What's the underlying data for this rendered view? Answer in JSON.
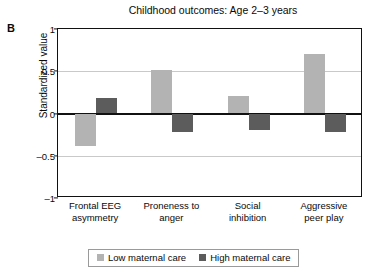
{
  "panel": {
    "label": "B"
  },
  "chart_data": {
    "type": "bar",
    "title": "Childhood outcomes: Age 2–3 years",
    "xlabel": "",
    "ylabel": "Standardized value",
    "ylim": [
      -1,
      1
    ],
    "yticks": [
      "1",
      "0.5",
      "0",
      "–0.5",
      "–1"
    ],
    "ytick_values": [
      1,
      0.5,
      0,
      -0.5,
      -1
    ],
    "grid": true,
    "legend_position": "bottom",
    "categories": [
      "Frontal EEG asymmetry",
      "Proneness to anger",
      "Social inhibition",
      "Aggressive peer play"
    ],
    "category_lines": [
      [
        "Frontal EEG",
        "asymmetry"
      ],
      [
        "Proneness to",
        "anger"
      ],
      [
        "Social",
        "inhibition"
      ],
      [
        "Aggressive",
        "peer play"
      ]
    ],
    "series": [
      {
        "name": "Low maternal care",
        "color": "#b3b3b3",
        "values": [
          -0.38,
          0.51,
          0.21,
          0.7
        ]
      },
      {
        "name": "High maternal care",
        "color": "#5c5c5c",
        "values": [
          0.18,
          -0.22,
          -0.2,
          -0.22
        ]
      }
    ]
  }
}
